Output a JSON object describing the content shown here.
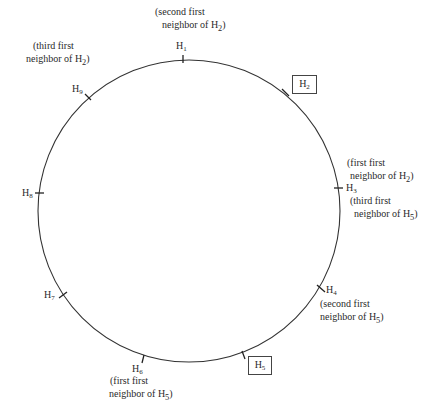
{
  "diagram": {
    "title": "",
    "ring": {
      "cx": 189,
      "cy": 211,
      "r": 151,
      "stroke": "#333333"
    },
    "sites": [
      {
        "id": "H1",
        "base": "H",
        "sub": "1",
        "boxed": false
      },
      {
        "id": "H2",
        "base": "H",
        "sub": "2",
        "boxed": true
      },
      {
        "id": "H3",
        "base": "H",
        "sub": "3",
        "boxed": false
      },
      {
        "id": "H4",
        "base": "H",
        "sub": "4",
        "boxed": false
      },
      {
        "id": "H5",
        "base": "H",
        "sub": "5",
        "boxed": true
      },
      {
        "id": "H6",
        "base": "H",
        "sub": "6",
        "boxed": false
      },
      {
        "id": "H7",
        "base": "H",
        "sub": "7",
        "boxed": false
      },
      {
        "id": "H8",
        "base": "H",
        "sub": "8",
        "boxed": false
      },
      {
        "id": "H9",
        "base": "H",
        "sub": "9",
        "boxed": false
      }
    ],
    "annotations": {
      "H1": {
        "line1": "(second first",
        "line2a": "neighbor of H",
        "line2sub": "2",
        "line2b": ")"
      },
      "H9": {
        "line1": "(third first",
        "line2a": "neighbor of H",
        "line2sub": "2",
        "line2b": ")"
      },
      "H3_above": {
        "line1": "(first first",
        "line2a": "neighbor of H",
        "line2sub": "2",
        "line2b": ")"
      },
      "H3_below": {
        "line1": "(third first",
        "line2a": "neighbor of H",
        "line2sub": "5",
        "line2b": ")"
      },
      "H4": {
        "line1": "(second first",
        "line2a": "neighbor of  H",
        "line2sub": "5",
        "line2b": ")"
      },
      "H6": {
        "line1": "(first first",
        "line2a": "neighbor of H",
        "line2sub": "5",
        "line2b": ")"
      }
    }
  }
}
